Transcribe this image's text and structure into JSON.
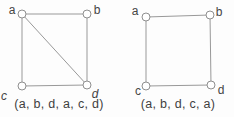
{
  "figure": {
    "background_color": "#fdfdfd",
    "edge_color": "#999999",
    "vertex_stroke_color": "#8f8f8f",
    "vertex_fill_color": "#ffffff",
    "label_color": "#454545",
    "vertex_radius": 4,
    "canvas_width": 234,
    "canvas_height": 117
  },
  "graphs": [
    {
      "id": "left-graph",
      "caption": "(a, b, d, a, c, d)",
      "vertices": [
        {
          "id": "a",
          "x": 22,
          "y": 14,
          "lx": 12,
          "ly": 10,
          "italic": false
        },
        {
          "id": "b",
          "x": 87,
          "y": 14,
          "lx": 97,
          "ly": 10,
          "italic": false
        },
        {
          "id": "c",
          "x": 22,
          "y": 86,
          "lx": 4,
          "ly": 96,
          "italic": true
        },
        {
          "id": "d",
          "x": 87,
          "y": 85,
          "lx": 95,
          "ly": 94,
          "italic": true
        }
      ],
      "edges": [
        [
          "a",
          "b"
        ],
        [
          "a",
          "c"
        ],
        [
          "b",
          "d"
        ],
        [
          "c",
          "d"
        ],
        [
          "a",
          "d"
        ]
      ]
    },
    {
      "id": "right-graph",
      "caption": "(a, b, d, c, a)",
      "vertices": [
        {
          "id": "a",
          "x": 146,
          "y": 17,
          "lx": 135,
          "ly": 11,
          "italic": false
        },
        {
          "id": "b",
          "x": 210,
          "y": 15,
          "lx": 219,
          "ly": 12,
          "italic": false
        },
        {
          "id": "c",
          "x": 146,
          "y": 86,
          "lx": 138,
          "ly": 91,
          "italic": false
        },
        {
          "id": "d",
          "x": 211,
          "y": 85,
          "lx": 221,
          "ly": 90,
          "italic": false
        }
      ],
      "edges": [
        [
          "a",
          "b"
        ],
        [
          "a",
          "c"
        ],
        [
          "b",
          "d"
        ],
        [
          "c",
          "d"
        ]
      ]
    }
  ]
}
